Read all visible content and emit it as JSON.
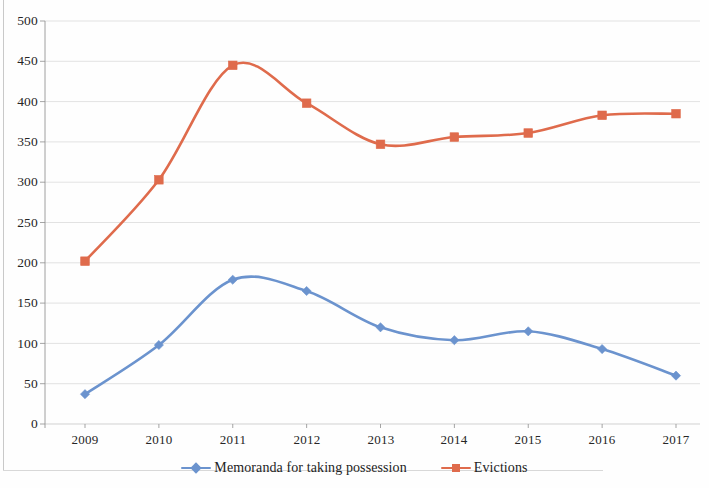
{
  "chart_data": {
    "type": "line",
    "title": "",
    "subtitle": "",
    "xlabel": "",
    "ylabel": "",
    "categories": [
      "2009",
      "2010",
      "2011",
      "2012",
      "2013",
      "2014",
      "2015",
      "2016",
      "2017"
    ],
    "x": [
      2009,
      2010,
      2011,
      2012,
      2013,
      2014,
      2015,
      2016,
      2017
    ],
    "series": [
      {
        "name": "Memoranda for taking possession",
        "color": "#6B93CE",
        "marker": "diamond",
        "values": [
          37,
          98,
          179,
          165,
          120,
          104,
          115,
          93,
          60
        ]
      },
      {
        "name": "Evictions",
        "color": "#DF6B4C",
        "marker": "square",
        "values": [
          202,
          303,
          445,
          398,
          347,
          356,
          361,
          383,
          385
        ]
      }
    ],
    "ylim": [
      0,
      500
    ],
    "ytick_step": 50,
    "yticks": [
      "0",
      "50",
      "100",
      "150",
      "200",
      "250",
      "300",
      "350",
      "400",
      "450",
      "500"
    ],
    "grid": true,
    "grid_axis": "y",
    "legend_position": "bottom",
    "smoothed": true
  },
  "axis": {
    "y_tick_labels": [
      "500",
      "450",
      "400",
      "350",
      "300",
      "250",
      "200",
      "150",
      "100",
      "50",
      "0"
    ],
    "x_tick_labels": [
      "2009",
      "2010",
      "2011",
      "2012",
      "2013",
      "2014",
      "2015",
      "2016",
      "2017"
    ]
  },
  "legend": {
    "items": [
      {
        "label": "Memoranda for taking possession",
        "color": "#6B93CE",
        "marker": "diamond"
      },
      {
        "label": "Evictions",
        "color": "#DF6B4C",
        "marker": "square"
      }
    ]
  },
  "colors": {
    "series_blue": "#6B93CE",
    "series_orange": "#DF6B4C",
    "gridline": "#c4c4c4",
    "axis": "#8f8f8f",
    "text": "#262626"
  }
}
